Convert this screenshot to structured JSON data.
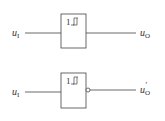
{
  "diagram": {
    "type": "logic-gates",
    "gates": [
      {
        "id": "schmitt-buffer",
        "symbol_text": "1",
        "symbol_icon": "hysteresis-icon",
        "inverted_output": false,
        "input_label": "u",
        "input_sub": "I",
        "output_label": "u",
        "output_sub": "O",
        "output_prime": ""
      },
      {
        "id": "schmitt-inverter",
        "symbol_text": "1",
        "symbol_icon": "hysteresis-icon",
        "inverted_output": true,
        "input_label": "u",
        "input_sub": "I",
        "output_label": "u",
        "output_sub": "O",
        "output_prime": "′"
      }
    ],
    "colors": {
      "stroke": "#444444",
      "text": "#333333",
      "background": "#ffffff"
    }
  }
}
